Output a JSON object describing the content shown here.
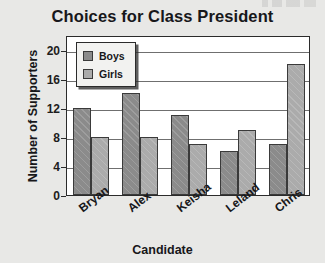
{
  "chart_data": {
    "type": "bar",
    "title": "Choices for Class President",
    "xlabel": "Candidate",
    "ylabel": "Number of Supporters",
    "categories": [
      "Bryan",
      "Alex",
      "Keisha",
      "Leland",
      "Chris"
    ],
    "series": [
      {
        "name": "Boys",
        "color": "#8b8b8b",
        "values": [
          12,
          14,
          11,
          6,
          7
        ]
      },
      {
        "name": "Girls",
        "color": "#ababab",
        "values": [
          8,
          8,
          7,
          9,
          18
        ]
      }
    ],
    "ylim": [
      0,
      22
    ],
    "yticks": [
      0,
      4,
      8,
      12,
      16,
      20
    ],
    "ytick_labels": [
      "0",
      "4",
      "8",
      "12",
      "16",
      "20"
    ],
    "grid": "horizontal",
    "legend_position": "top-left"
  },
  "colors": {
    "page_background": "#e8e8e6",
    "plot_background": "#ffffff",
    "axis": "#2b2b2b",
    "gridline": "#6f6f6f",
    "text": "#17171a",
    "boys": "#8b8b8b",
    "girls": "#ababab"
  }
}
